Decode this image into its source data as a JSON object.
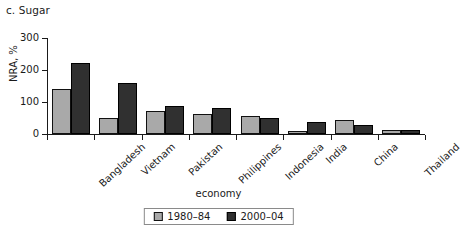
{
  "chart_data": {
    "type": "bar",
    "title": "c. Sugar",
    "xlabel": "economy",
    "ylabel": "NRA, %",
    "categories": [
      "Bangladesh",
      "Vietnam",
      "Pakistan",
      "Philippines",
      "Indonesia",
      "India",
      "China",
      "Thailand"
    ],
    "series": [
      {
        "name": "1980–84",
        "color": "#a9a9a9",
        "values": [
          140,
          50,
          72,
          61,
          55,
          8,
          44,
          14
        ]
      },
      {
        "name": "2000–04",
        "color": "#303030",
        "values": [
          222,
          160,
          88,
          80,
          50,
          39,
          27,
          14
        ]
      }
    ],
    "ylim": [
      0,
      300
    ],
    "yticks": [
      0,
      100,
      200,
      300
    ],
    "ytick_labels": [
      "0",
      "100",
      "200",
      "300"
    ],
    "grid": false,
    "legend_position": "bottom-center"
  }
}
